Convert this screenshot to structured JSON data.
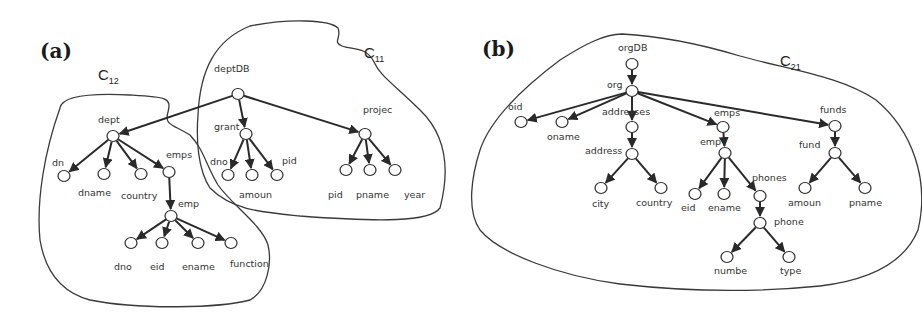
{
  "panels": [
    {
      "id": "a",
      "label": "(a)",
      "label_pos": [
        40,
        58
      ],
      "clusters": [
        {
          "name": "C",
          "sub": "12",
          "pos": [
            98,
            80
          ],
          "path": "M60,108 C62,96 90,93 130,95 C165,97 172,97 168,112 C164,125 172,124 190,135 C204,150 206,165 218,185 C232,205 262,225 268,245 C272,262 268,290 250,300 C220,308 140,310 90,300 C60,292 45,270 40,240 C36,200 45,150 60,108 Z"
        },
        {
          "name": "C",
          "sub": "11",
          "pos": [
            364,
            58
          ],
          "path": "M198,115 C200,70 215,40 250,26 C290,18 330,20 338,28 C342,38 332,42 342,46 C352,50 366,46 374,62 C380,76 395,85 420,110 C446,135 450,170 440,208 C430,222 380,222 300,216 C260,212 232,210 210,188 C198,170 196,140 198,115 Z"
        }
      ],
      "nodes": [
        {
          "id": "deptDB",
          "label": "deptDB",
          "x": 238,
          "y": 94,
          "lx": 214,
          "ly": 72
        },
        {
          "id": "dept",
          "label": "dept",
          "x": 113,
          "y": 136,
          "lx": 98,
          "ly": 123
        },
        {
          "id": "dn",
          "label": "dn",
          "x": 64,
          "y": 176,
          "lx": 52,
          "ly": 166
        },
        {
          "id": "dname",
          "label": "dname",
          "x": 104,
          "y": 174,
          "lx": 78,
          "ly": 196
        },
        {
          "id": "country",
          "label": "country",
          "x": 141,
          "y": 174,
          "lx": 121,
          "ly": 199
        },
        {
          "id": "emps",
          "label": "emps",
          "x": 169,
          "y": 172,
          "lx": 166,
          "ly": 158
        },
        {
          "id": "emp",
          "label": "emp",
          "x": 171,
          "y": 216,
          "lx": 178,
          "ly": 207
        },
        {
          "id": "dno1",
          "label": "dno",
          "x": 131,
          "y": 243,
          "lx": 114,
          "ly": 270
        },
        {
          "id": "eid1",
          "label": "eid",
          "x": 162,
          "y": 243,
          "lx": 150,
          "ly": 270
        },
        {
          "id": "ename1",
          "label": "ename",
          "x": 198,
          "y": 243,
          "lx": 182,
          "ly": 270
        },
        {
          "id": "function",
          "label": "function",
          "x": 231,
          "y": 243,
          "lx": 230,
          "ly": 267
        },
        {
          "id": "grant",
          "label": "grant",
          "x": 246,
          "y": 134,
          "lx": 214,
          "ly": 130
        },
        {
          "id": "dno2",
          "label": "dno",
          "x": 228,
          "y": 175,
          "lx": 210,
          "ly": 165
        },
        {
          "id": "amoun1",
          "label": "amoun",
          "x": 252,
          "y": 175,
          "lx": 239,
          "ly": 198
        },
        {
          "id": "pid1",
          "label": "pid",
          "x": 277,
          "y": 175,
          "lx": 282,
          "ly": 164
        },
        {
          "id": "projec",
          "label": "projec",
          "x": 365,
          "y": 134,
          "lx": 363,
          "ly": 113
        },
        {
          "id": "pid2",
          "label": "pid",
          "x": 346,
          "y": 170,
          "lx": 328,
          "ly": 198
        },
        {
          "id": "pname1",
          "label": "pname",
          "x": 370,
          "y": 170,
          "lx": 356,
          "ly": 198
        },
        {
          "id": "year",
          "label": "year",
          "x": 395,
          "y": 170,
          "lx": 404,
          "ly": 198
        }
      ],
      "edges": [
        [
          "deptDB",
          "dept"
        ],
        [
          "deptDB",
          "grant"
        ],
        [
          "deptDB",
          "projec"
        ],
        [
          "dept",
          "dn"
        ],
        [
          "dept",
          "dname"
        ],
        [
          "dept",
          "country"
        ],
        [
          "dept",
          "emps"
        ],
        [
          "emps",
          "emp"
        ],
        [
          "emp",
          "dno1"
        ],
        [
          "emp",
          "eid1"
        ],
        [
          "emp",
          "ename1"
        ],
        [
          "emp",
          "function"
        ],
        [
          "grant",
          "dno2"
        ],
        [
          "grant",
          "amoun1"
        ],
        [
          "grant",
          "pid1"
        ],
        [
          "projec",
          "pid2"
        ],
        [
          "projec",
          "pname1"
        ],
        [
          "projec",
          "year"
        ]
      ]
    },
    {
      "id": "b",
      "label": "(b)",
      "label_pos": [
        482,
        56
      ],
      "clusters": [
        {
          "name": "C",
          "sub": "21",
          "pos": [
            780,
            66
          ],
          "path": "M622,34 C660,36 700,44 740,56 C790,70 840,76 876,100 C912,130 930,180 918,230 C905,262 870,280 820,286 C760,292 690,292 620,284 C560,276 500,254 480,230 C466,210 472,175 480,150 C490,120 520,90 560,60 C585,44 605,34 622,34 Z"
        }
      ],
      "nodes": [
        {
          "id": "orgDB",
          "label": "orgDB",
          "x": 632,
          "y": 64,
          "lx": 618,
          "ly": 51
        },
        {
          "id": "org",
          "label": "org",
          "x": 632,
          "y": 91,
          "lx": 607,
          "ly": 88
        },
        {
          "id": "oid",
          "label": "oid",
          "x": 521,
          "y": 122,
          "lx": 508,
          "ly": 110
        },
        {
          "id": "oname",
          "label": "oname",
          "x": 562,
          "y": 122,
          "lx": 547,
          "ly": 140
        },
        {
          "id": "addresses",
          "label": "addresses",
          "x": 632,
          "y": 127,
          "lx": 602,
          "ly": 115
        },
        {
          "id": "address",
          "label": "address",
          "x": 632,
          "y": 154,
          "lx": 585,
          "ly": 154
        },
        {
          "id": "city",
          "label": "city",
          "x": 601,
          "y": 188,
          "lx": 592,
          "ly": 207
        },
        {
          "id": "country2",
          "label": "country",
          "x": 661,
          "y": 188,
          "lx": 636,
          "ly": 206
        },
        {
          "id": "emps2",
          "label": "emps",
          "x": 723,
          "y": 127,
          "lx": 714,
          "ly": 116
        },
        {
          "id": "emp2",
          "label": "emp",
          "x": 725,
          "y": 153,
          "lx": 700,
          "ly": 145
        },
        {
          "id": "eid2",
          "label": "eid",
          "x": 695,
          "y": 194,
          "lx": 681,
          "ly": 211
        },
        {
          "id": "ename2",
          "label": "ename",
          "x": 724,
          "y": 194,
          "lx": 708,
          "ly": 211
        },
        {
          "id": "phones",
          "label": "phones",
          "x": 760,
          "y": 196,
          "lx": 752,
          "ly": 181
        },
        {
          "id": "phone",
          "label": "phone",
          "x": 760,
          "y": 223,
          "lx": 774,
          "ly": 225
        },
        {
          "id": "numbe",
          "label": "numbe",
          "x": 727,
          "y": 257,
          "lx": 714,
          "ly": 274
        },
        {
          "id": "type",
          "label": "type",
          "x": 789,
          "y": 257,
          "lx": 780,
          "ly": 274
        },
        {
          "id": "funds",
          "label": "funds",
          "x": 835,
          "y": 126,
          "lx": 820,
          "ly": 113
        },
        {
          "id": "fund",
          "label": "fund",
          "x": 835,
          "y": 153,
          "lx": 799,
          "ly": 148
        },
        {
          "id": "amoun2",
          "label": "amoun",
          "x": 805,
          "y": 188,
          "lx": 788,
          "ly": 206
        },
        {
          "id": "pname2",
          "label": "pname",
          "x": 865,
          "y": 188,
          "lx": 849,
          "ly": 206
        }
      ],
      "edges": [
        [
          "orgDB",
          "org"
        ],
        [
          "org",
          "oid"
        ],
        [
          "org",
          "oname"
        ],
        [
          "org",
          "addresses"
        ],
        [
          "org",
          "emps2"
        ],
        [
          "org",
          "funds"
        ],
        [
          "addresses",
          "address"
        ],
        [
          "address",
          "city"
        ],
        [
          "address",
          "country2"
        ],
        [
          "emps2",
          "emp2"
        ],
        [
          "emp2",
          "eid2"
        ],
        [
          "emp2",
          "ename2"
        ],
        [
          "emp2",
          "phones"
        ],
        [
          "phones",
          "phone"
        ],
        [
          "phone",
          "numbe"
        ],
        [
          "phone",
          "type"
        ],
        [
          "funds",
          "fund"
        ],
        [
          "fund",
          "amoun2"
        ],
        [
          "fund",
          "pname2"
        ]
      ]
    }
  ],
  "style": {
    "node_rx": 6,
    "node_ry": 5.5,
    "stroke_color": "#2a2a2a",
    "background": "#ffffff"
  }
}
